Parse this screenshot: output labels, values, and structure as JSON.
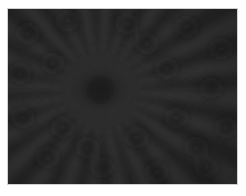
{
  "image": {
    "subject": "dark radial starburst pattern",
    "colors": {
      "background": "#262626",
      "ray_light": "#3a3a3a",
      "ray_dark": "#1a1a1a",
      "border": "#d0d0d0",
      "page": "#ffffff"
    },
    "center": {
      "x": 93,
      "y": 82
    },
    "ray_count": 24
  }
}
